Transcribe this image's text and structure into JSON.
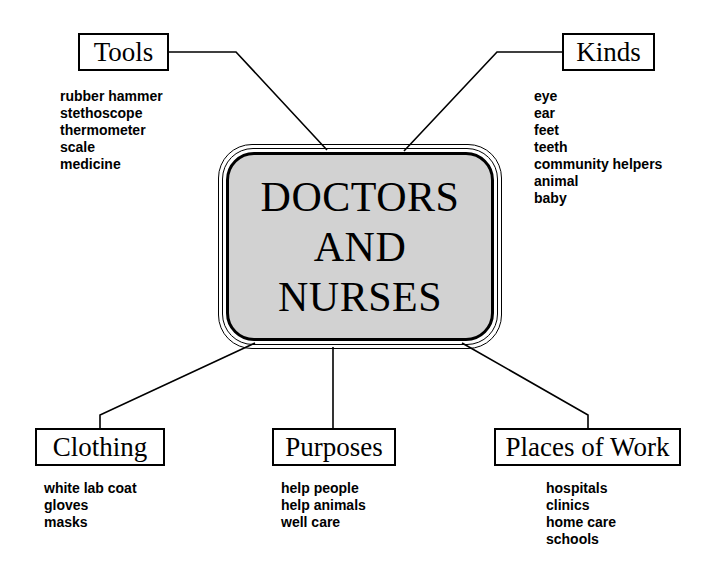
{
  "diagram": {
    "center": {
      "title": "DOCTORS\nAND\nNURSES",
      "fill_color": "#d2d2d2",
      "line_color": "#000000"
    },
    "branches": [
      {
        "id": "tools",
        "label": "Tools",
        "items": [
          "rubber hammer",
          "stethoscope",
          "thermometer",
          "scale",
          "medicine"
        ]
      },
      {
        "id": "kinds",
        "label": "Kinds",
        "items": [
          "eye",
          "ear",
          "feet",
          "teeth",
          "community helpers",
          "animal",
          "baby"
        ]
      },
      {
        "id": "clothing",
        "label": "Clothing",
        "items": [
          "white lab coat",
          "gloves",
          "masks"
        ]
      },
      {
        "id": "purposes",
        "label": "Purposes",
        "items": [
          "help people",
          "help animals",
          "well care"
        ]
      },
      {
        "id": "places",
        "label": "Places of Work",
        "items": [
          "hospitals",
          "clinics",
          "home care",
          "schools"
        ]
      }
    ]
  }
}
